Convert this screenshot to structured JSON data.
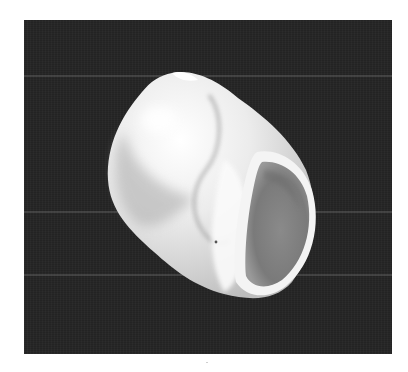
{
  "image": {
    "subject": "snail shell",
    "background_color": "#232323",
    "frame_color": "#ffffff",
    "shell_color": "#f2f2f2",
    "aperture_color": "#7e7e7e",
    "scanlines_y": [
      55,
      191,
      254
    ]
  }
}
